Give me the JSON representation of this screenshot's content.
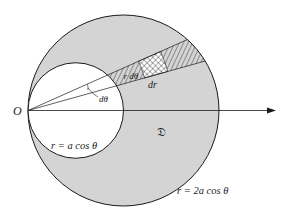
{
  "figure": {
    "origin_label": "O",
    "region_label": "𝔇",
    "inner_curve_label": "r = a cos θ",
    "outer_curve_label": "r = 2a cos θ",
    "arc_element_label": "r dθ",
    "radial_element_label": "dr",
    "angle_label": "dθ"
  },
  "colors": {
    "region_fill": "#d4d4d4",
    "stroke": "#1a1a1a",
    "background": "#ffffff"
  }
}
